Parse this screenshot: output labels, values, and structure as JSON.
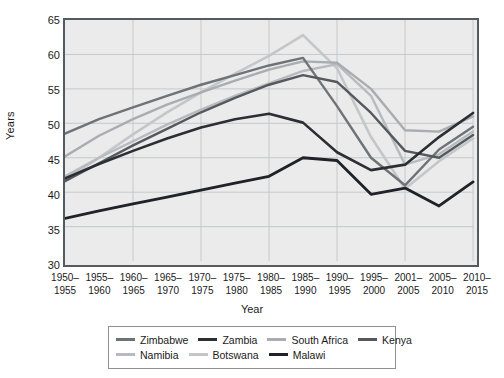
{
  "chart_data": {
    "type": "line",
    "title": "",
    "xlabel": "Year",
    "ylabel": "Years",
    "ylim": [
      30,
      65
    ],
    "ytick_step": 5,
    "yticks": [
      65,
      60,
      55,
      50,
      45,
      40,
      35,
      30
    ],
    "grid": true,
    "legend_position": "bottom",
    "categories": [
      "1950–\n1955",
      "1955–\n1960",
      "1960–\n1965",
      "1965–\n1970",
      "1970–\n1975",
      "1975–\n1980",
      "1980–\n1985",
      "1985–\n1990",
      "1990–\n1995",
      "1995–\n2000",
      "2001–\n2005",
      "2005–\n2010",
      "2010–\n2015"
    ],
    "category_lines": [
      [
        "1950–",
        "1955"
      ],
      [
        "1955–",
        "1960"
      ],
      [
        "1960–",
        "1965"
      ],
      [
        "1965–",
        "1970"
      ],
      [
        "1970–",
        "1975"
      ],
      [
        "1975–",
        "1980"
      ],
      [
        "1980–",
        "1985"
      ],
      [
        "1985–",
        "1990"
      ],
      [
        "1990–",
        "1995"
      ],
      [
        "1995–",
        "2000"
      ],
      [
        "2001–",
        "2005"
      ],
      [
        "2005–",
        "2010"
      ],
      [
        "2010–",
        "2015"
      ]
    ],
    "series": [
      {
        "name": "Zimbabwe",
        "color": "#6e7377",
        "width": 2.4,
        "values": [
          48.5,
          50.6,
          52.3,
          54.0,
          55.6,
          57.0,
          58.4,
          59.5,
          52.5,
          45.0,
          41.0,
          46.2,
          49.5
        ]
      },
      {
        "name": "Zambia",
        "color": "#2b2f33",
        "width": 2.6,
        "values": [
          42.0,
          44.1,
          46.0,
          47.8,
          49.4,
          50.6,
          51.4,
          50.1,
          45.8,
          43.2,
          44.0,
          48.0,
          51.5
        ]
      },
      {
        "name": "South Africa",
        "color": "#a9adb1",
        "width": 2.4,
        "values": [
          45.2,
          48.2,
          50.6,
          52.7,
          54.5,
          56.2,
          57.8,
          59.0,
          58.8,
          55.0,
          49.0,
          48.8,
          51.0
        ]
      },
      {
        "name": "Kenya",
        "color": "#55595d",
        "width": 2.4,
        "values": [
          41.6,
          44.2,
          46.8,
          49.2,
          51.6,
          53.7,
          55.6,
          57.0,
          56.0,
          51.5,
          46.0,
          45.0,
          48.3
        ]
      },
      {
        "name": "Namibia",
        "color": "#b7bbbf",
        "width": 2.4,
        "values": [
          42.3,
          45.0,
          47.4,
          49.8,
          52.0,
          54.0,
          55.8,
          57.6,
          58.6,
          54.0,
          44.0,
          45.5,
          48.8
        ]
      },
      {
        "name": "Botswana",
        "color": "#c3c7ca",
        "width": 2.6,
        "values": [
          41.8,
          45.0,
          48.4,
          51.6,
          54.5,
          57.2,
          59.8,
          62.8,
          58.0,
          48.0,
          40.5,
          44.5,
          47.8
        ]
      },
      {
        "name": "Malawi",
        "color": "#1f2327",
        "width": 2.8,
        "values": [
          36.2,
          37.3,
          38.3,
          39.3,
          40.3,
          41.3,
          42.3,
          45.0,
          44.6,
          39.7,
          40.6,
          38.0,
          41.5
        ]
      }
    ]
  },
  "legend": {
    "rows": [
      [
        "Zimbabwe",
        "Zambia",
        "South Africa",
        "Kenya"
      ],
      [
        "Namibia",
        "Botswana",
        "Malawi"
      ]
    ]
  },
  "axes": {
    "y_title": "Years",
    "x_title": "Year"
  },
  "style": {
    "plot_background": "#ebebeb",
    "page_background": "#ffffff",
    "grid_color": "#c4c8cb",
    "frame_color": "#555a5e"
  }
}
